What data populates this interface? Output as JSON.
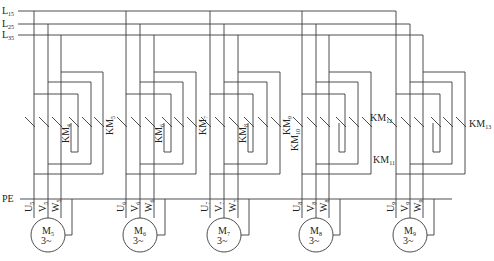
{
  "buses": [
    {
      "label": "L",
      "sub": "15",
      "y": 11,
      "end_x": 396
    },
    {
      "label": "L",
      "sub": "25",
      "y": 24,
      "end_x": 410
    },
    {
      "label": "L",
      "sub": "35",
      "y": 35,
      "end_x": 423
    }
  ],
  "pe": {
    "label": "PE",
    "y": 199
  },
  "motors": [
    {
      "name": "M",
      "sub": "5",
      "rating": "3~",
      "phases": [
        {
          "l": "U",
          "s": "5"
        },
        {
          "l": "V",
          "s": "5"
        },
        {
          "l": "W",
          "s": "5"
        }
      ],
      "x": [
        34,
        48,
        61
      ],
      "loop_x": [
        78,
        91,
        103
      ],
      "contactors": [
        {
          "l": "KM",
          "s": "4",
          "pos": "inner"
        },
        {
          "l": "KM",
          "s": "5",
          "pos": "right"
        }
      ]
    },
    {
      "name": "M",
      "sub": "6",
      "rating": "3~",
      "phases": [
        {
          "l": "U",
          "s": "6"
        },
        {
          "l": "V",
          "s": "6"
        },
        {
          "l": "W",
          "s": "6"
        }
      ],
      "x": [
        126,
        140,
        154
      ],
      "loop_x": [
        171,
        183,
        196
      ],
      "contactors": [
        {
          "l": "KM",
          "s": "6",
          "pos": "inner"
        },
        {
          "l": "KM",
          "s": "7",
          "pos": "right"
        }
      ]
    },
    {
      "name": "M",
      "sub": "7",
      "rating": "3~",
      "phases": [
        {
          "l": "U",
          "s": "7"
        },
        {
          "l": "V",
          "s": "7"
        },
        {
          "l": "W",
          "s": "7"
        }
      ],
      "x": [
        210,
        224,
        238
      ],
      "loop_x": [
        253,
        267,
        280
      ],
      "contactors": [
        {
          "l": "KM",
          "s": "8",
          "pos": "inner"
        },
        {
          "l": "KM",
          "s": "9",
          "pos": "right"
        }
      ]
    },
    {
      "name": "M",
      "sub": "8",
      "rating": "3~",
      "phases": [
        {
          "l": "U",
          "s": "8"
        },
        {
          "l": "V",
          "s": "8"
        },
        {
          "l": "W",
          "s": "8"
        }
      ],
      "x": [
        302,
        316,
        329
      ],
      "loop_x": [
        345,
        358,
        371
      ],
      "contactors": [
        {
          "l": "KM",
          "s": "10",
          "pos": "left"
        },
        {
          "l": "KM",
          "s": "11",
          "pos": "right-h"
        }
      ]
    },
    {
      "name": "M",
      "sub": "9",
      "rating": "3~",
      "phases": [
        {
          "l": "U",
          "s": "9"
        },
        {
          "l": "V",
          "s": "9"
        },
        {
          "l": "W",
          "s": "9"
        }
      ],
      "x": [
        396,
        410,
        423
      ],
      "loop_x": [
        440,
        452,
        465
      ],
      "contactors": [
        {
          "l": "KM",
          "s": "12",
          "pos": "left-h"
        },
        {
          "l": "KM",
          "s": "13",
          "pos": "right-h"
        }
      ]
    }
  ]
}
